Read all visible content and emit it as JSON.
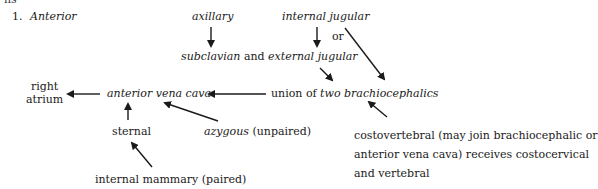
{
  "heading": {
    "number": "1.",
    "label": "Anterior",
    "cropped_top_text": "ns"
  },
  "nodes": {
    "axillary": "axillary",
    "internal_jugular": "internal jugular",
    "or": "or",
    "subclavian": "subclavian",
    "and": " and ",
    "external_jugular": "external jugular",
    "right_atrium_1": "right",
    "right_atrium_2": "atrium",
    "anterior_vena_cava": "anterior vena cava",
    "union_of": "union of ",
    "two_brachiocephalics": "two brachiocephalics",
    "sternal": "sternal",
    "azygous": "azygous",
    "unpaired": " (unpaired)",
    "costovertebral_1": "costovertebral (may join brachiocephalic or",
    "costovertebral_2": "anterior vena cava) receives costocervical",
    "costovertebral_3": "and vertebral",
    "internal_mammary": "internal mammary (paired)"
  },
  "colors": {
    "text": "#1a1a1a",
    "arrow": "#1a1a1a",
    "background": "#ffffff"
  }
}
